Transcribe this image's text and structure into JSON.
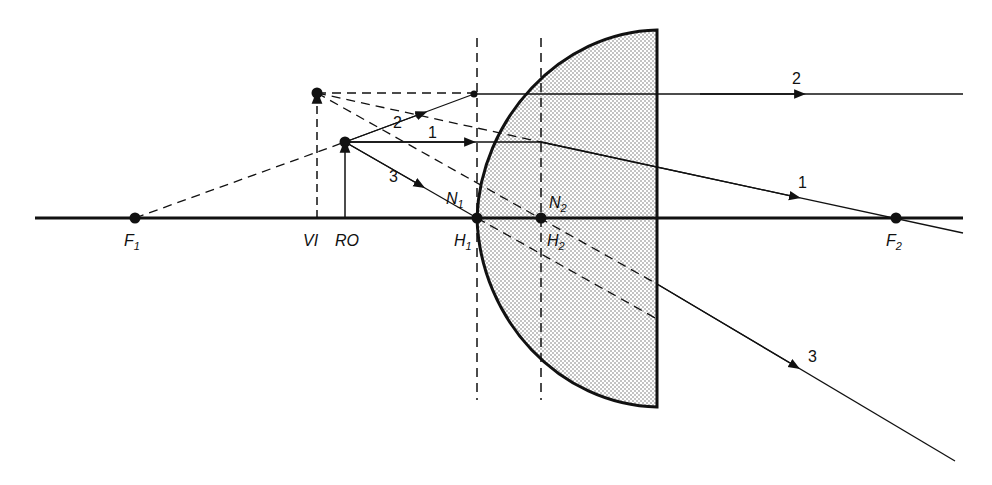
{
  "diagram": {
    "type": "optics-ray-diagram",
    "points": {
      "F1": {
        "label": "F",
        "sub": "1",
        "x": 135,
        "y": 218
      },
      "F2": {
        "label": "F",
        "sub": "2",
        "x": 896,
        "y": 218
      },
      "H1": {
        "label": "H",
        "sub": "1",
        "x": 477,
        "y": 218
      },
      "H2": {
        "label": "H",
        "sub": "2",
        "x": 541,
        "y": 218
      },
      "N1": {
        "label": "N",
        "sub": "1"
      },
      "N2": {
        "label": "N",
        "sub": "2"
      },
      "object_tip": {
        "x": 345,
        "y": 142
      },
      "image_tip": {
        "x": 317,
        "y": 93
      }
    },
    "labels": {
      "VI": "VI",
      "RO": "RO"
    },
    "rays": [
      {
        "id": "1",
        "label": "1"
      },
      {
        "id": "2",
        "label": "2"
      },
      {
        "id": "3",
        "label": "3"
      }
    ],
    "colors": {
      "ink": "#111111",
      "lens_fill": "#d8d8d8"
    }
  }
}
